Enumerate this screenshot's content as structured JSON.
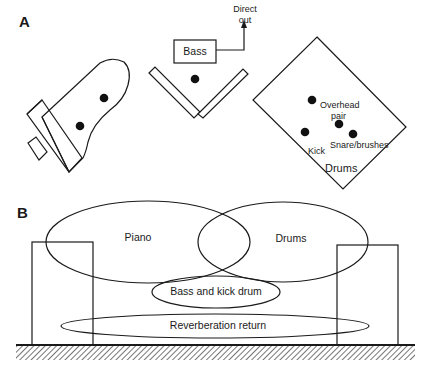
{
  "panels": {
    "a": {
      "label": "A",
      "piano": {
        "name": "piano-plan"
      },
      "bass": {
        "label": "Bass",
        "direct_out_line1": "Direct",
        "direct_out_line2": "out"
      },
      "drums": {
        "label": "Drums",
        "overhead_line1": "Overhead",
        "overhead_line2": "pair",
        "kick": "Kick",
        "snare": "Snare/brushes"
      }
    },
    "b": {
      "label": "B",
      "zones": {
        "piano": "Piano",
        "drums": "Drums",
        "bass_kick": "Bass and kick drum",
        "reverb": "Reverberation return"
      }
    }
  },
  "colors": {
    "line": "#1a1a1a",
    "background": "#ffffff"
  }
}
